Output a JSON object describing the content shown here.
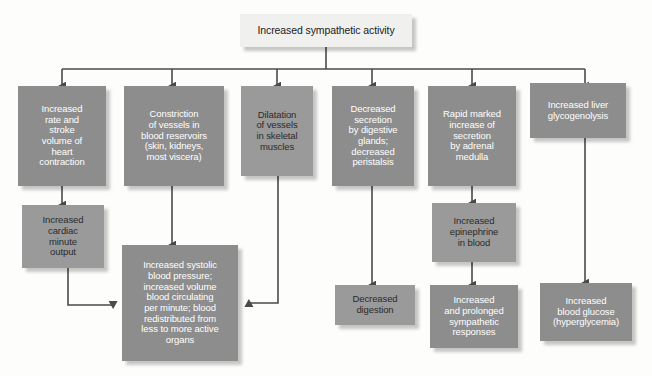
{
  "diagram": {
    "title": "Increased sympathetic activity",
    "colors": {
      "dark_box": "#8d8d8d",
      "mid_box": "#9a9a9a",
      "light_box": "#f0f0ee",
      "connector": "#4a4a4a",
      "dark_text": "#1b1b1b",
      "light_text": "#ffffff",
      "background": "#fdfdfc"
    },
    "root": {
      "label": "Increased sympathetic activity",
      "style": "light"
    },
    "level1": [
      {
        "id": "heart-rate",
        "label": "Increased\nrate and\nstroke\nvolume of\nheart\ncontraction",
        "style": "dark"
      },
      {
        "id": "vasoconstriction",
        "label": "Constriction\nof vessels in\nblood reservoirs\n(skin, kidneys,\nmost viscera)",
        "style": "dark"
      },
      {
        "id": "vasodilatation",
        "label": "Dilatation\nof vessels\nin skeletal\nmuscles",
        "style": "mid"
      },
      {
        "id": "digestive-secretion",
        "label": "Decreased\nsecretion\nby digestive\nglands;\ndecreased\nperistalsis",
        "style": "dark"
      },
      {
        "id": "adrenal-medulla",
        "label": "Rapid marked\nincrease of\nsecretion\nby adrenal\nmedulla",
        "style": "dark"
      },
      {
        "id": "liver-glycogenolysis",
        "label": "Increased liver\nglycogenolysis",
        "style": "dark"
      }
    ],
    "level2": [
      {
        "id": "cardiac-output",
        "label": "Increased\ncardiac\nminute\noutput",
        "style": "mid"
      },
      {
        "id": "epinephrine",
        "label": "Increased\nepinephrine\nin blood",
        "style": "mid"
      }
    ],
    "level3": [
      {
        "id": "systolic-pressure",
        "label": "Increased systolic\nblood pressure;\nincreased volume\nblood circulating\nper minute; blood\nredistributed from\nless to more active\norgans",
        "style": "dark"
      },
      {
        "id": "decreased-digestion",
        "label": "Decreased\ndigestion",
        "style": "mid"
      },
      {
        "id": "sympathetic-responses",
        "label": "Increased\nand prolonged\nsympathetic\nresponses",
        "style": "dark"
      },
      {
        "id": "blood-glucose",
        "label": "Increased\nblood glucose\n(hyperglycemia)",
        "style": "dark"
      }
    ]
  }
}
